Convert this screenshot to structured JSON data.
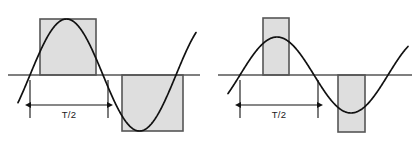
{
  "figure": {
    "background_color": "#ffffff",
    "width": 418,
    "height": 149,
    "colors": {
      "curve": "#111111",
      "axis": "#555555",
      "rect_fill": "#dedede",
      "rect_stroke": "#565656",
      "dimension_line": "#111111",
      "label_text": "#1a1a1a"
    },
    "panels": [
      {
        "id": "left-panel",
        "name": "wide-rectangle-approximation",
        "baseline": {
          "x1": 8,
          "x2": 200,
          "y": 75
        },
        "wave": {
          "type": "sine",
          "x_start": 18,
          "x_end": 196,
          "period": 146,
          "amplitude": 56,
          "phase_zero_x": 30,
          "baseline_y": 75
        },
        "rectangles": [
          {
            "name": "positive-half-cycle-rect",
            "x": 40,
            "y": 19,
            "width": 56,
            "height": 56,
            "polarity": "positive"
          },
          {
            "name": "negative-half-cycle-rect",
            "x": 122,
            "y": 75,
            "width": 61,
            "height": 56,
            "polarity": "negative"
          }
        ],
        "dimension": {
          "name": "half-period-dimension",
          "label": "T/2",
          "line_y": 105,
          "x1": 30,
          "x2": 108,
          "tick_top_y": 80,
          "tick_bottom_y": 118,
          "label_x": 69,
          "label_y": 118
        }
      },
      {
        "id": "right-panel",
        "name": "narrow-rectangle-approximation",
        "baseline": {
          "x1": 218,
          "x2": 412,
          "y": 75
        },
        "wave": {
          "type": "sine",
          "x_start": 228,
          "x_end": 408,
          "period": 148,
          "amplitude": 38,
          "phase_zero_x": 240,
          "baseline_y": 75
        },
        "rectangles": [
          {
            "name": "positive-half-cycle-rect",
            "x": 263,
            "y": 18,
            "width": 26,
            "height": 57,
            "polarity": "positive"
          },
          {
            "name": "negative-half-cycle-rect",
            "x": 338,
            "y": 75,
            "width": 27,
            "height": 57,
            "polarity": "negative"
          }
        ],
        "dimension": {
          "name": "half-period-dimension",
          "label": "T/2",
          "line_y": 105,
          "x1": 240,
          "x2": 318,
          "tick_top_y": 80,
          "tick_bottom_y": 118,
          "label_x": 279,
          "label_y": 118
        }
      }
    ]
  }
}
